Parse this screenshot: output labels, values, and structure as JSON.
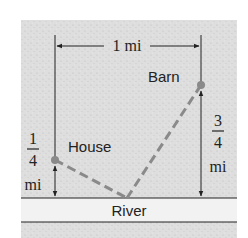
{
  "diagram": {
    "labels": {
      "width": "1 mi",
      "barn": "Barn",
      "house": "House",
      "river": "River",
      "house_dist_num": "1",
      "house_dist_den": "4",
      "house_dist_unit": "mi",
      "barn_dist_num": "3",
      "barn_dist_den": "4",
      "barn_dist_unit": "mi"
    },
    "colors": {
      "land": "#dcdcdc",
      "river": "#f2f2f2",
      "path": "#8a8a8a",
      "ink": "#222222"
    },
    "points": {
      "house": [
        55,
        160
      ],
      "barn": [
        201,
        85
      ],
      "river_point": [
        127,
        198
      ]
    }
  }
}
